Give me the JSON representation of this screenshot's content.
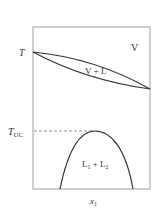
{
  "diagram": {
    "labels": {
      "T": "T",
      "T_uc_main": "T",
      "T_uc_sub": "UC",
      "vapor": "V",
      "vapor_liquid": "V + L",
      "liquid_liquid": "L",
      "l1_sub": "1",
      "plus": " + ",
      "l2": "L",
      "l2_sub": "2",
      "x_axis": "x",
      "x_axis_sub": "1"
    },
    "colors": {
      "line": "#333333",
      "frame": "#999999",
      "dashed": "#666666"
    }
  }
}
